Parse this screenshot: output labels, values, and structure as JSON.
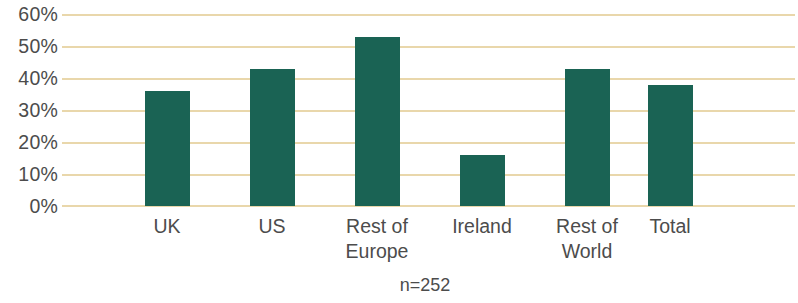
{
  "chart_data": {
    "type": "bar",
    "title": "",
    "subtitle": "",
    "xlabel": "",
    "ylabel": "",
    "categories": [
      "UK",
      "US",
      "Rest of\nEurope",
      "Ireland",
      "Rest of\nWorld",
      "Total"
    ],
    "values": [
      36,
      43,
      53,
      16,
      43,
      38
    ],
    "ylim": [
      0,
      60
    ],
    "ytick_labels": [
      "60%",
      "50%",
      "40%",
      "30%",
      "20%",
      "10%",
      "0%"
    ],
    "ytick_values": [
      60,
      50,
      40,
      30,
      20,
      10,
      0
    ],
    "grid": true,
    "grid_axis": "y",
    "legend": false,
    "legend_position": "none",
    "annotations": [
      {
        "name": "sample-size",
        "text": "n=252"
      }
    ],
    "series": [
      {
        "name": "",
        "values": [
          36,
          43,
          53,
          16,
          43,
          38
        ]
      }
    ],
    "colors": {
      "bar": "#1a6354",
      "gridline": "#e9d7ab",
      "text": "#4c4c4c",
      "background": "#ffffff"
    }
  }
}
